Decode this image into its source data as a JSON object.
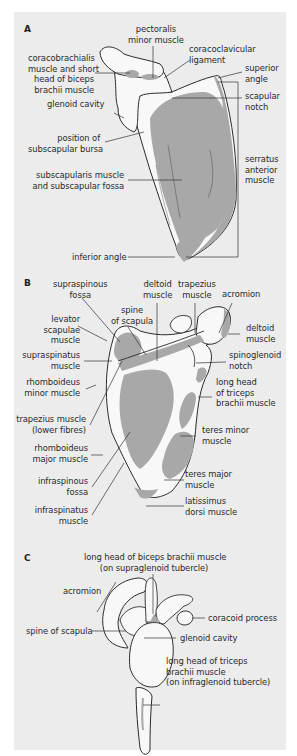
{
  "figure": {
    "colors": {
      "background": "#ececec",
      "bone": "#f8f8f8",
      "muscle": "#a8a8a8",
      "outline": "#2b2b2b",
      "leader": "#333333"
    },
    "panels": [
      {
        "letter": "A",
        "view": "anterior (costal) surface of scapula",
        "labels": [
          {
            "id": "pectoralis_minor",
            "lines": [
              "pectoralis",
              "minor muscle"
            ]
          },
          {
            "id": "coracoclavicular",
            "lines": [
              "coracoclavicular",
              "ligament"
            ]
          },
          {
            "id": "coracobrachialis",
            "lines": [
              "coracobrachialis",
              "muscle and short",
              "head of biceps",
              "brachii muscle"
            ]
          },
          {
            "id": "superior_angle",
            "lines": [
              "superior",
              "angle"
            ]
          },
          {
            "id": "scapular_notch",
            "lines": [
              "scapular",
              "notch"
            ]
          },
          {
            "id": "glenoid_cavity",
            "lines": [
              "glenoid cavity"
            ]
          },
          {
            "id": "subscapular_bursa",
            "lines": [
              "position of",
              "subscapular bursa"
            ]
          },
          {
            "id": "serratus_anterior",
            "lines": [
              "serratus",
              "anterior",
              "muscle"
            ]
          },
          {
            "id": "subscapularis",
            "lines": [
              "subscapularis muscle",
              "and subscapular fossa"
            ]
          },
          {
            "id": "inferior_angle",
            "lines": [
              "inferior angle"
            ]
          }
        ]
      },
      {
        "letter": "B",
        "view": "posterior surface of scapula",
        "labels": [
          {
            "id": "supraspinous_fossa",
            "lines": [
              "supraspinous",
              "fossa"
            ]
          },
          {
            "id": "deltoid_top",
            "lines": [
              "deltoid",
              "muscle"
            ]
          },
          {
            "id": "trapezius_top",
            "lines": [
              "trapezius",
              "muscle"
            ]
          },
          {
            "id": "acromion",
            "lines": [
              "acromion"
            ]
          },
          {
            "id": "spine",
            "lines": [
              "spine",
              "of scapula"
            ]
          },
          {
            "id": "levator",
            "lines": [
              "levator",
              "scapulae",
              "muscle"
            ]
          },
          {
            "id": "deltoid_right",
            "lines": [
              "deltoid",
              "muscle"
            ]
          },
          {
            "id": "supraspinatus",
            "lines": [
              "supraspinatus",
              "muscle"
            ]
          },
          {
            "id": "spinoglenoid",
            "lines": [
              "spinoglenoid",
              "notch"
            ]
          },
          {
            "id": "rhomboid_minor",
            "lines": [
              "rhomboideus",
              "minor muscle"
            ]
          },
          {
            "id": "triceps_long",
            "lines": [
              "long head",
              "of triceps",
              "brachii muscle"
            ]
          },
          {
            "id": "trapezius_lower",
            "lines": [
              "trapezius muscle",
              "(lower fibres)"
            ]
          },
          {
            "id": "teres_minor",
            "lines": [
              "teres minor",
              "muscle"
            ]
          },
          {
            "id": "rhomboid_major",
            "lines": [
              "rhomboideus",
              "major muscle"
            ]
          },
          {
            "id": "infraspinous_fossa",
            "lines": [
              "infraspinous",
              "fossa"
            ]
          },
          {
            "id": "teres_major",
            "lines": [
              "teres major",
              "muscle"
            ]
          },
          {
            "id": "infraspinatus",
            "lines": [
              "infraspinatus",
              "muscle"
            ]
          },
          {
            "id": "latissimus",
            "lines": [
              "latissimus",
              "dorsi muscle"
            ]
          }
        ]
      },
      {
        "letter": "C",
        "view": "lateral view of scapula",
        "labels": [
          {
            "id": "biceps_long",
            "lines": [
              "long head of biceps brachii muscle",
              "(on supraglenoid tubercle)"
            ]
          },
          {
            "id": "acromion",
            "lines": [
              "acromion"
            ]
          },
          {
            "id": "coracoid",
            "lines": [
              "coracoid process"
            ]
          },
          {
            "id": "spine",
            "lines": [
              "spine of scapula"
            ]
          },
          {
            "id": "glenoid",
            "lines": [
              "glenoid cavity"
            ]
          },
          {
            "id": "triceps_long",
            "lines": [
              "long head of triceps",
              "brachii muscle",
              "(on infraglenoid tubercle)"
            ]
          }
        ]
      }
    ]
  }
}
